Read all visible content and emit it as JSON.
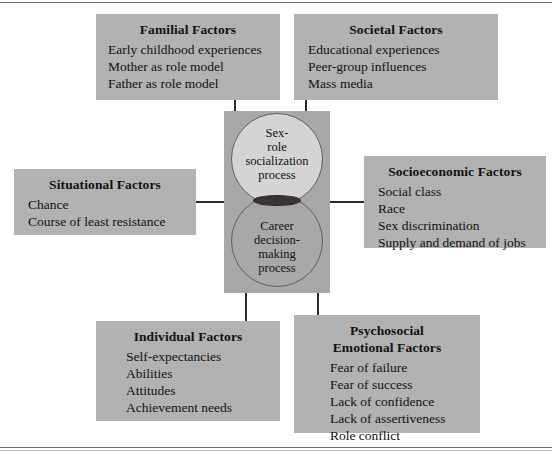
{
  "figure": {
    "center": {
      "panel_color": "#a8a8a8",
      "upper_circle": {
        "color": "#d4d4d4",
        "lines": [
          "Sex-",
          "role",
          "socialization",
          "process"
        ]
      },
      "lower_circle": {
        "color": "#a8a8a8",
        "lines": [
          "Career",
          "decision-",
          "making",
          "process"
        ]
      },
      "overlap_color": "#3a3236"
    },
    "boxes": [
      {
        "id": "familial",
        "title_lines": [
          "Familial Factors"
        ],
        "items": [
          "Early childhood experiences",
          "Mother as role model",
          "Father as role model"
        ]
      },
      {
        "id": "societal",
        "title_lines": [
          "Societal Factors"
        ],
        "items": [
          "Educational experiences",
          "Peer-group influences",
          "Mass media"
        ]
      },
      {
        "id": "situational",
        "title_lines": [
          "Situational Factors"
        ],
        "items": [
          "Chance",
          "Course of least resistance"
        ]
      },
      {
        "id": "socioeconomic",
        "title_lines": [
          "Socioeconomic Factors"
        ],
        "items": [
          "Social class",
          "Race",
          "Sex discrimination",
          "Supply and demand of jobs"
        ]
      },
      {
        "id": "individual",
        "title_lines": [
          "Individual Factors"
        ],
        "items": [
          "Self-expectancies",
          "Abilities",
          "Attitudes",
          "Achievement needs"
        ]
      },
      {
        "id": "psychosocial",
        "title_lines": [
          "Psychosocial",
          "Emotional Factors"
        ],
        "items": [
          "Fear of failure",
          "Fear of success",
          "Lack of confidence",
          "Lack of assertiveness",
          "Role conflict"
        ]
      }
    ],
    "box_color": "#b2b2b2",
    "connector_color": "#2b2b2b"
  }
}
